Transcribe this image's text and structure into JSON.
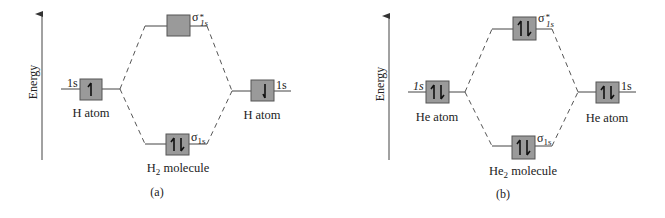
{
  "panels": [
    {
      "id": "a",
      "caption": "(a)",
      "axis_label": "Energy",
      "left_atom": {
        "label": "H atom",
        "orbital": "1s",
        "electrons": [
          "up"
        ]
      },
      "right_atom": {
        "label": "H atom",
        "orbital": "1s",
        "electrons": [
          "down"
        ]
      },
      "antibonding": {
        "symbol": "σ",
        "superscript": "*",
        "subscript": "1s",
        "electrons": []
      },
      "bonding": {
        "symbol": "σ",
        "subscript": "1s",
        "electrons": [
          "up",
          "down"
        ]
      },
      "molecule": {
        "base": "H",
        "sub": "2",
        "suffix": " molecule"
      }
    },
    {
      "id": "b",
      "caption": "(b)",
      "axis_label": "Energy",
      "left_atom": {
        "label": "He atom",
        "orbital": "1s",
        "electrons": [
          "up",
          "down"
        ]
      },
      "right_atom": {
        "label": "He atom",
        "orbital": "1s",
        "electrons": [
          "up",
          "down"
        ]
      },
      "antibonding": {
        "symbol": "σ",
        "superscript": "*",
        "subscript": "1s",
        "electrons": [
          "up",
          "down"
        ]
      },
      "bonding": {
        "symbol": "σ",
        "subscript": "1s",
        "electrons": [
          "up",
          "down"
        ]
      },
      "molecule": {
        "base": "He",
        "sub": "2",
        "suffix": " molecule"
      }
    }
  ],
  "colors": {
    "box_fill": "#9a9a9a",
    "line": "#444444",
    "background": "#ffffff"
  }
}
